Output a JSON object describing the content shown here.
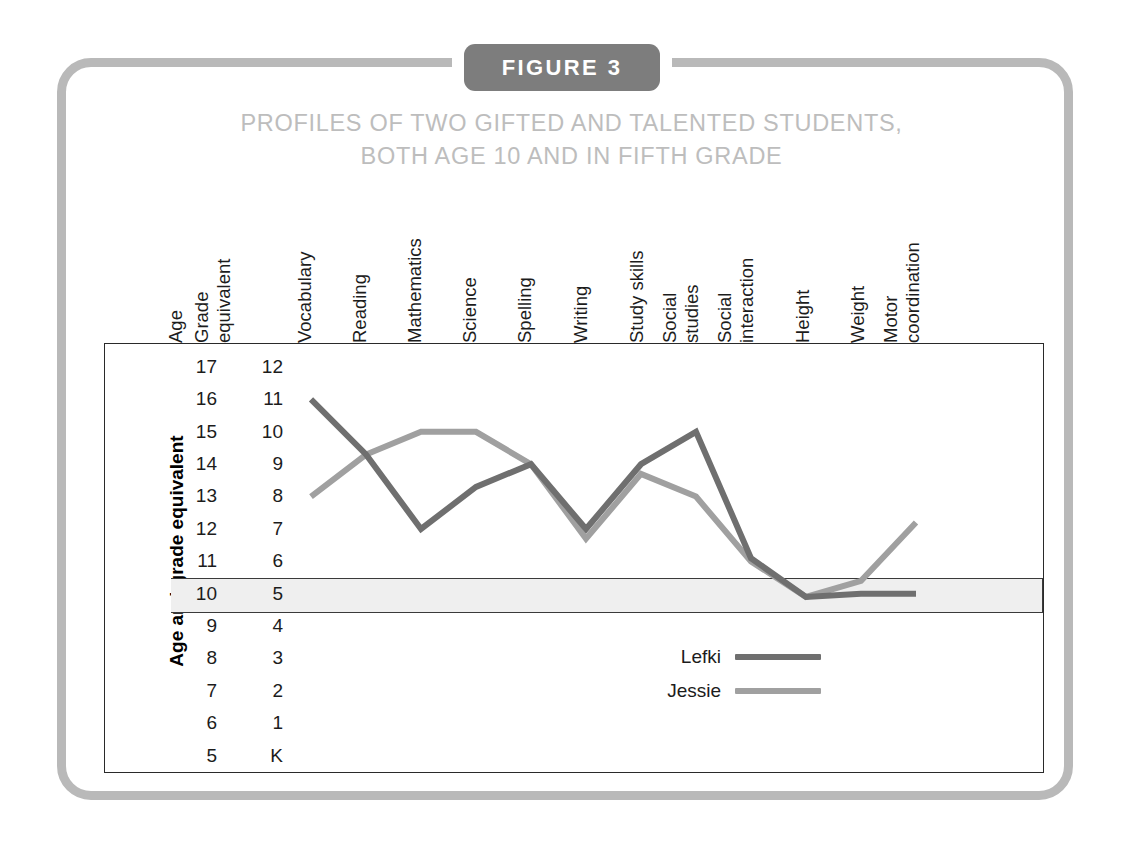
{
  "figure": {
    "tab_label": "FIGURE 3",
    "title_line1": "PROFILES OF TWO GIFTED AND TALENTED STUDENTS,",
    "title_line2": "BOTH AGE 10 AND IN FIFTH GRADE"
  },
  "axis": {
    "left_label": "Age and grade equivalent",
    "age_header": "Age",
    "grade_header_line1": "Grade",
    "grade_header_line2": "equivalent"
  },
  "scale": {
    "ages": [
      "17",
      "16",
      "15",
      "14",
      "13",
      "12",
      "11",
      "10",
      "9",
      "8",
      "7",
      "6",
      "5"
    ],
    "grades": [
      "12",
      "11",
      "10",
      "9",
      "8",
      "7",
      "6",
      "5",
      "4",
      "3",
      "2",
      "1",
      "K"
    ],
    "highlighted_age": "10",
    "highlighted_grade": "5"
  },
  "legend": {
    "items": [
      {
        "label": "Lefki",
        "color": "#6f6f6f"
      },
      {
        "label": "Jessie",
        "color": "#a0a0a0"
      }
    ]
  },
  "colors": {
    "frame": "#b9b9b9",
    "tab_background": "#7d7d7d",
    "title": "#bdbdbd",
    "lefki": "#6f6f6f",
    "jessie": "#a0a0a0",
    "highlight_band": "#efefef",
    "plot_border": "#2a2a2a"
  },
  "chart_data": {
    "type": "line",
    "title": "PROFILES OF TWO GIFTED AND TALENTED STUDENTS, BOTH AGE 10 AND IN FIFTH GRADE",
    "xlabel": "",
    "ylabel": "Age and grade equivalent",
    "grid": false,
    "legend_position": "inside-bottom-right",
    "ylim": [
      5,
      17
    ],
    "y_secondary_label": "Grade equivalent",
    "y_secondary_ticks": [
      "K",
      "1",
      "2",
      "3",
      "4",
      "5",
      "6",
      "7",
      "8",
      "9",
      "10",
      "11",
      "12"
    ],
    "y_ticks_age": [
      5,
      6,
      7,
      8,
      9,
      10,
      11,
      12,
      13,
      14,
      15,
      16,
      17
    ],
    "categories": [
      "Vocabulary",
      "Reading",
      "Mathematics",
      "Science",
      "Spelling",
      "Writing",
      "Study skills",
      "Social studies",
      "Social interaction",
      "Height",
      "Weight",
      "Motor coordination"
    ],
    "series": [
      {
        "name": "Lefki",
        "color": "#6f6f6f",
        "values": [
          16,
          14.3,
          12,
          13.3,
          14,
          12,
          14,
          15,
          11.1,
          9.9,
          10,
          10
        ]
      },
      {
        "name": "Jessie",
        "color": "#a0a0a0",
        "values": [
          13,
          14.3,
          15,
          15,
          14,
          11.7,
          13.7,
          13,
          11,
          9.9,
          10.4,
          12.2
        ]
      }
    ],
    "annotations": [
      "Highlighted band marks age 10 / grade 5 — the chronological age and grade of both students."
    ]
  }
}
